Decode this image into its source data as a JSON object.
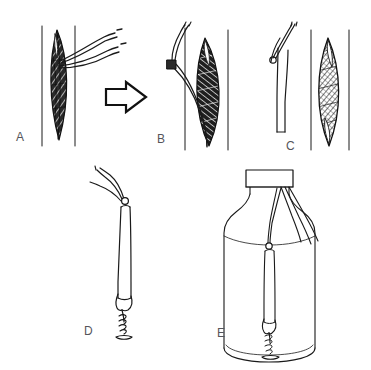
{
  "figure": {
    "background_color": "#ffffff",
    "ink_color": "#1a1a1a",
    "label_color": "#55555a",
    "faint_header_color": "#f2f2f4",
    "width": 371,
    "height": 370,
    "header": {
      "running_title": "",
      "page_number": ""
    },
    "panels": [
      {
        "id": "A",
        "label": "A",
        "label_x": 16,
        "label_y": 131,
        "caption_text": "A",
        "content_description": "shaded-lens-specimen-with-two-sutures-between-vertical-walls"
      },
      {
        "id": "B",
        "label": "B",
        "label_x": 157,
        "label_y": 133,
        "caption_text": "B",
        "content_description": "tube-end-with-sutures-drawn-alongside-hatched-lens-specimen"
      },
      {
        "id": "C",
        "label": "C",
        "label_x": 286,
        "label_y": 140,
        "caption_text": "C",
        "content_description": "separated-catheter-tube-with-knot-and-detached-hatched-lens-specimen"
      },
      {
        "id": "D",
        "label": "D",
        "label_x": 84,
        "label_y": 325,
        "caption_text": "D",
        "content_description": "vertical-tube-suspended-by-sutures-with-coiled-weight-at-lower-end"
      },
      {
        "id": "E",
        "label": "E",
        "label_x": 217,
        "label_y": 327,
        "caption_text": "E",
        "content_description": "assembly-suspended-inside-capped-specimen-bottle"
      }
    ],
    "arrow": {
      "name": "transition-arrow-a-to-b",
      "direction": "right",
      "x": 104,
      "y": 82,
      "width": 44,
      "height": 30
    }
  }
}
